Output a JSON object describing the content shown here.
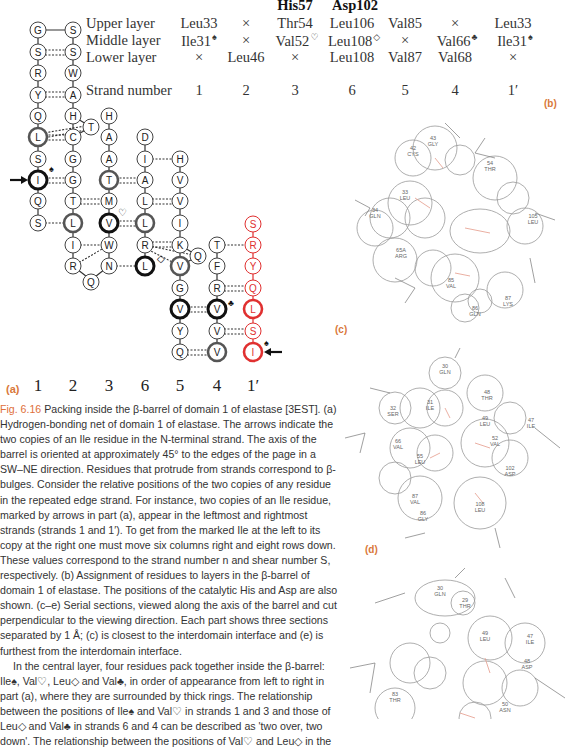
{
  "table": {
    "header_row": [
      {
        "col": 3,
        "label": "His57"
      },
      {
        "col": 4,
        "label": "Asp102"
      }
    ],
    "row_labels": [
      "Upper layer",
      "Middle layer",
      "Lower layer",
      "Strand number"
    ],
    "columns": [
      {
        "strand": "1",
        "upper": "Leu33",
        "middle": "Ile31",
        "middle_mark": "♠",
        "lower": "×"
      },
      {
        "strand": "2",
        "upper": "×",
        "middle": "×",
        "middle_mark": "",
        "lower": "Leu46"
      },
      {
        "strand": "3",
        "upper": "Thr54",
        "middle": "Val52",
        "middle_mark": "♡",
        "lower": "×"
      },
      {
        "strand": "6",
        "upper": "Leu106",
        "middle": "Leu108",
        "middle_mark": "◇",
        "lower": "Leu108"
      },
      {
        "strand": "5",
        "upper": "Val85",
        "middle": "×",
        "middle_mark": "",
        "lower": "Val87"
      },
      {
        "strand": "4",
        "upper": "×",
        "middle": "Val66",
        "middle_mark": "♣",
        "lower": "Val68"
      },
      {
        "strand": "1′",
        "upper": "Leu33",
        "middle": "Ile31",
        "middle_mark": "♠",
        "lower": "×"
      }
    ]
  },
  "panels": {
    "a": "(a)",
    "b": "(b)",
    "c": "(c)",
    "d": "(d)"
  },
  "diagram": {
    "strand_labels": [
      "1",
      "2",
      "3",
      "6",
      "5",
      "4",
      "1′"
    ],
    "strands": [
      {
        "name": "1",
        "start_row": 1,
        "residues": [
          "G",
          "S",
          "R",
          "Y",
          "Q",
          "L",
          "S",
          "I",
          "Q",
          "S"
        ]
      },
      {
        "name": "2",
        "start_row": 1,
        "residues": [
          "S",
          "S",
          "W",
          "A",
          "H",
          "C",
          "G",
          "G",
          "T",
          "L",
          "I",
          "R"
        ]
      },
      {
        "name": "3",
        "start_row": 5,
        "residues": [
          "H",
          "A",
          "A",
          "T",
          "M",
          "V",
          "W",
          "N"
        ]
      },
      {
        "name": "6",
        "start_row": 6,
        "residues": [
          "D",
          "I",
          "A",
          "L",
          "L",
          "R",
          "L"
        ]
      },
      {
        "name": "5",
        "start_row": 7,
        "residues": [
          "H",
          "V",
          "V",
          "I",
          "K",
          "V",
          "G",
          "V",
          "Y",
          "Q"
        ]
      },
      {
        "name": "4",
        "start_row": 11,
        "residues": [
          "T",
          "F",
          "R",
          "V",
          "V",
          "V"
        ]
      },
      {
        "name": "1′",
        "start_row": 10,
        "residues": [
          "S",
          "R",
          "Y",
          "Q",
          "L",
          "S",
          "I"
        ],
        "color": "#e03030"
      }
    ],
    "bulges": [
      {
        "between": "2-3",
        "row": 5.5,
        "residue": "T"
      },
      {
        "between": "2-3",
        "row": 13,
        "residue": "Q"
      },
      {
        "between": "5-4",
        "row": 11.6,
        "residue": "Q"
      }
    ],
    "markers": {
      "ile": "♠",
      "val_strand3": "♡",
      "leu_strand6": "◇",
      "val_strand4": "♣",
      "arrow": "➞"
    }
  },
  "caption": {
    "fig_label": "Fig. 6.16",
    "text": "Packing inside the β-barrel of domain 1 of elastase [3EST]. (a) Hydrogen-bonding net of domain 1 of elastase. The arrows indicate the two copies of an Ile residue in the N-terminal strand. The axis of the barrel is oriented at approximately 45° to the edges of the page in a SW–NE direction. Residues that protrude from strands correspond to β-bulges. Consider the relative positions of the two copies of any residue in the repeated edge strand. For instance, two copies of an Ile residue, marked by arrows in part (a), appear in the leftmost and rightmost strands (strands 1 and 1′). To get from the marked Ile at the left to its copy at the right one must move six columns right and eight rows down. These values correspond to the strand number n and shear number S, respectively. (b) Assignment of residues to layers in the β-barrel of domain 1 of elastase. The positions of the catalytic His and Asp are also shown. (c–e) Serial sections, viewed along the axis of the barrel and cut perpendicular to the viewing direction. Each part shows three sections separated by 1 Å; (c) is closest to the interdomain interface and (e) is furthest from the interdomain interface.",
    "body_paragraph": "In the central layer, four residues pack together inside the β-barrel: Ile♠, Val♡, Leu◇ and Val♣, in order of appearance from left to right in part (a), where they are surrounded by thick rings. The relationship between the positions of Ile♠ and Val♡ in strands 1 and 3 and those of Leu◇ and Val♣ in strands 6 and 4 can be described as 'two over, two down'. The relationship between the positions of Val♡ and Leu◇ in the"
  },
  "sections": {
    "c": [
      {
        "num": "43",
        "res": "GLY"
      },
      {
        "num": "42",
        "res": "CYS"
      },
      {
        "num": "54",
        "res": "THR"
      },
      {
        "num": "33",
        "res": "LEU"
      },
      {
        "num": "34",
        "res": "GLN"
      },
      {
        "num": "105",
        "res": "LEU"
      },
      {
        "num": "65A",
        "res": "ARG"
      },
      {
        "num": "85",
        "res": "VAL"
      },
      {
        "num": "87",
        "res": "LYS"
      },
      {
        "num": "86",
        "res": "GLN"
      }
    ],
    "d": [
      {
        "num": "30",
        "res": "GLN"
      },
      {
        "num": "48",
        "res": "THR"
      },
      {
        "num": "32",
        "res": "SER"
      },
      {
        "num": "31",
        "res": "ILE"
      },
      {
        "num": "49",
        "res": "LEU"
      },
      {
        "num": "47",
        "res": "ILE"
      },
      {
        "num": "52",
        "res": "VAL"
      },
      {
        "num": "66",
        "res": "VAL"
      },
      {
        "num": "55",
        "res": "LEU"
      },
      {
        "num": "102",
        "res": "ASP"
      },
      {
        "num": "87",
        "res": "VAL"
      },
      {
        "num": "108",
        "res": "LEU"
      },
      {
        "num": "86",
        "res": "GLY"
      }
    ],
    "e": [
      {
        "num": "30",
        "res": "GLN"
      },
      {
        "num": "29",
        "res": "THR"
      },
      {
        "num": "49",
        "res": "LEU"
      },
      {
        "num": "47",
        "res": "ILE"
      },
      {
        "num": "48",
        "res": "ASP"
      },
      {
        "num": "50",
        "res": "ASN"
      },
      {
        "num": "83",
        "res": "THR"
      }
    ]
  },
  "colors": {
    "accent": "#e0703a",
    "red_strand": "#e03030",
    "ink": "#222222"
  }
}
